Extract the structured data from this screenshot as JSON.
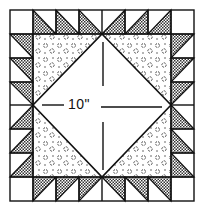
{
  "diagram": {
    "dimension_label": "10\"",
    "grid": {
      "cols": 8,
      "rows": 8,
      "x0": 10,
      "y0": 10,
      "x1": 194,
      "y1": 201
    },
    "colors": {
      "line": "#111111",
      "shade": "#555555",
      "background": "#ffffff",
      "print": "#333333"
    },
    "components": {
      "border": "half-square triangle units with plain corner squares",
      "center": "on-point square (white) with four printed corner triangles"
    }
  }
}
